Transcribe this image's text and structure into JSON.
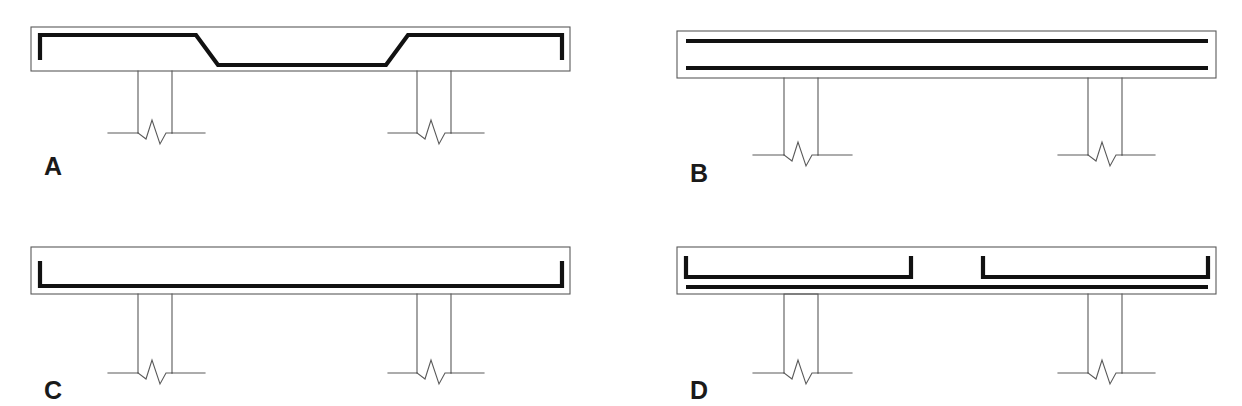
{
  "figure": {
    "background_color": "#ffffff",
    "bar_color": "#111111",
    "outline_color": "#5a5a5a"
  },
  "panels": [
    {
      "id": "A",
      "label": "A",
      "description": "Single cranked (bent-up) bar: high over the supports, stepping down diagonally to the slab soffit at midspan, with downturned hooks at both ends.",
      "bar_count": 1,
      "bar_type": "cranked",
      "end_hooks": "down",
      "columns": 2,
      "column_type": "open"
    },
    {
      "id": "B",
      "label": "B",
      "description": "Two straight continuous bars, one near the top face and one near the bottom face of the slab, running the full width with no end hooks.",
      "bar_count": 2,
      "bar_type": "straight",
      "end_hooks": "none",
      "columns": 2,
      "column_type": "open"
    },
    {
      "id": "C",
      "label": "C",
      "description": "Single straight bottom bar running the full slab width with upturned hooks at both ends.",
      "bar_count": 1,
      "bar_type": "straight-bottom",
      "end_hooks": "up",
      "columns": 2,
      "column_type": "open"
    },
    {
      "id": "D",
      "label": "D",
      "description": "Discontinuous top steel in two segments hooked upward at all four ends with a gap at midspan, over one continuous straight bottom bar.",
      "bar_count": 3,
      "bar_type": "split-top-plus-bottom",
      "end_hooks": "up",
      "columns": 2,
      "column_type": "mixed-capped-and-open"
    }
  ],
  "symbols": {
    "break_line": "zigzag break symbol indicating the column continues below",
    "grade_line": "horizontal line at the base of each column"
  }
}
